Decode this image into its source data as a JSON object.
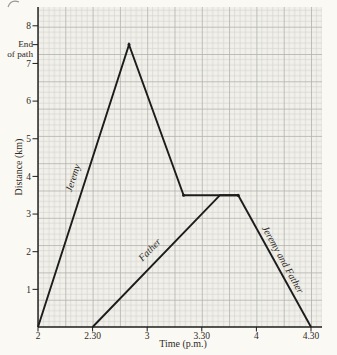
{
  "figure": {
    "kind": "textbook distance-time graph",
    "ylabel": "Distance (km)",
    "xlabel": "Time (p.m.)"
  },
  "colors": {
    "page_bg": "#fbf9f3",
    "plot_bg": "#f1f0ea",
    "grid_fine": "#d2d2cc",
    "grid_major": "#b3b3ac",
    "line": "#1c1c1c",
    "axis": "#1c1c1c",
    "text": "#2e2a26"
  },
  "chart_data": {
    "type": "line",
    "title": "",
    "xlabel": "Time (p.m.)",
    "ylabel": "Distance (km)",
    "grid": true,
    "legend_position": "labels-on-lines",
    "x_axis": {
      "unit": "time (p.m.)",
      "ticks": [
        {
          "t": "2:00",
          "label": "2"
        },
        {
          "t": "2:30",
          "label": "2.30"
        },
        {
          "t": "3:00",
          "label": "3"
        },
        {
          "t": "3:30",
          "label": "3.30"
        },
        {
          "t": "4:00",
          "label": "4"
        },
        {
          "t": "4:30",
          "label": "4.30"
        }
      ],
      "range": [
        "2:00",
        "4:36"
      ]
    },
    "y_axis": {
      "unit": "km",
      "ticks": [
        {
          "v": 1,
          "label": "1"
        },
        {
          "v": 2,
          "label": "2"
        },
        {
          "v": 3,
          "label": "3"
        },
        {
          "v": 4,
          "label": "4"
        },
        {
          "v": 5,
          "label": "5"
        },
        {
          "v": 6,
          "label": "6"
        },
        {
          "v": 7,
          "label": "7"
        },
        {
          "v": 7.5,
          "label": ""
        },
        {
          "v": 8,
          "label": "8"
        }
      ],
      "range": [
        0,
        8.5
      ]
    },
    "series": [
      {
        "name": "Jeremy",
        "points": [
          [
            "2:00",
            0
          ],
          [
            "2:50",
            7.5
          ],
          [
            "3:20",
            3.5
          ],
          [
            "3:50",
            3.5
          ]
        ]
      },
      {
        "name": "Father",
        "points": [
          [
            "2:30",
            0
          ],
          [
            "3:40",
            3.5
          ],
          [
            "3:50",
            3.5
          ]
        ]
      },
      {
        "name": "Jeremy and Father",
        "points": [
          [
            "3:50",
            3.5
          ],
          [
            "4:30",
            0
          ]
        ]
      }
    ],
    "annotations": {
      "end_of_path": {
        "line1": "End",
        "line2": "of path",
        "at_km": 7.5
      }
    },
    "series_labels": [
      {
        "text": "Jeremy",
        "x": 76,
        "y": 179,
        "rotate": -72
      },
      {
        "text": "Father",
        "x": 152,
        "y": 252,
        "rotate": -46
      },
      {
        "text": "Jeremy and Father",
        "x": 280,
        "y": 261,
        "rotate": 61
      }
    ]
  }
}
